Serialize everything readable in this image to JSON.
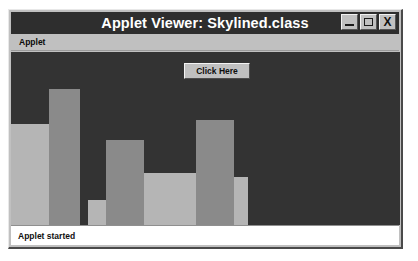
{
  "window": {
    "title": "Applet Viewer: Skylined.class",
    "controls": [
      {
        "name": "minimize-button",
        "icon": "minimize-icon",
        "label": ""
      },
      {
        "name": "maximize-button",
        "icon": "maximize-icon",
        "label": ""
      },
      {
        "name": "close-button",
        "icon": "close-icon",
        "label": "X"
      }
    ]
  },
  "menu": {
    "items": [
      {
        "label": "Applet"
      }
    ]
  },
  "applet": {
    "button_label": "Click Here",
    "background_color": "#333333",
    "bar_colors": {
      "light": "#b5b5b5",
      "medium": "#8a8a8a"
    }
  },
  "status": {
    "text": "Applet started"
  },
  "chart_data": {
    "type": "bar",
    "title": "Skyline",
    "xlabel": "",
    "ylabel": "",
    "grid": false,
    "legend": null,
    "categories": [
      "1",
      "2",
      "3",
      "4",
      "5",
      "6",
      "7"
    ],
    "values": [
      101,
      136,
      25,
      85,
      52,
      105,
      48
    ],
    "ylim": [
      0,
      173
    ],
    "bars": [
      {
        "x": 0,
        "width": 38,
        "height": 101,
        "color": "#b5b5b5"
      },
      {
        "x": 38,
        "width": 31,
        "height": 136,
        "color": "#8a8a8a"
      },
      {
        "x": 77,
        "width": 31,
        "height": 25,
        "color": "#b5b5b5"
      },
      {
        "x": 95,
        "width": 38,
        "height": 85,
        "color": "#8a8a8a"
      },
      {
        "x": 133,
        "width": 52,
        "height": 52,
        "color": "#b5b5b5"
      },
      {
        "x": 185,
        "width": 38,
        "height": 105,
        "color": "#8a8a8a"
      },
      {
        "x": 223,
        "width": 14,
        "height": 48,
        "color": "#b5b5b5"
      }
    ]
  }
}
